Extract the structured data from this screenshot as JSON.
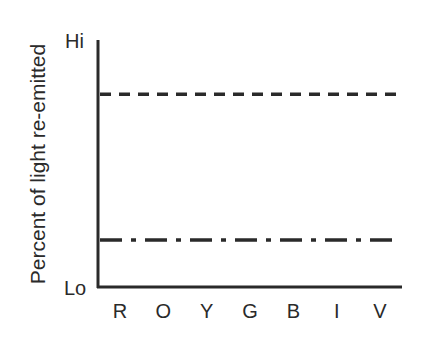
{
  "chart_data": {
    "type": "line",
    "title": "",
    "xlabel": "",
    "ylabel": "Percent of light re-emitted",
    "categories": [
      "R",
      "O",
      "Y",
      "G",
      "B",
      "I",
      "V"
    ],
    "y_tick_labels": {
      "top": "Hi",
      "bottom": "Lo"
    },
    "ylim": [
      0,
      1
    ],
    "grid": false,
    "legend": "none",
    "series": [
      {
        "name": "dashed-line",
        "style": "dashed",
        "values": [
          0.78,
          0.78,
          0.78,
          0.78,
          0.78,
          0.78,
          0.78
        ]
      },
      {
        "name": "dash-dot-line",
        "style": "dash-dot",
        "values": [
          0.19,
          0.19,
          0.19,
          0.19,
          0.19,
          0.19,
          0.19
        ]
      }
    ],
    "line_color": "#2a2a2a"
  }
}
